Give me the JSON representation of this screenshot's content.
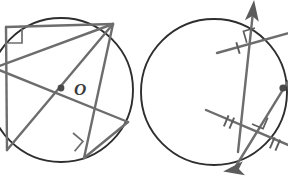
{
  "figure": {
    "background_color": "#ffffff",
    "width": 288,
    "height": 181,
    "colors": {
      "circle_stroke": "#2e2e2e",
      "chord_stroke": "#6d6d6d",
      "mark_stroke": "#5c5c5c",
      "point_fill": "#4a4a4a",
      "label_fill": "#3a3a3a"
    }
  },
  "left_figure": {
    "name": "inscribed-quadrilateral-with-diagonals",
    "circle": {
      "cx": 61,
      "cy": 90,
      "r": 72
    },
    "center_point": {
      "cx": 61,
      "cy": 88,
      "r": 3.2
    },
    "center_label": {
      "text": "O",
      "x": 74,
      "y": 95,
      "font_size": 17
    },
    "vertices": [
      {
        "name": "top-left",
        "x": 6,
        "y": 27
      },
      {
        "name": "top-right",
        "x": 113,
        "y": 24
      },
      {
        "name": "right",
        "x": 128,
        "y": 122
      },
      {
        "name": "bottom",
        "x": 84,
        "y": 158
      },
      {
        "name": "left-upper",
        "x": -6,
        "y": 68
      },
      {
        "name": "left-lower",
        "x": 7,
        "y": 150
      }
    ],
    "segments": [
      {
        "name": "top-chord",
        "x1": 6,
        "y1": 27,
        "x2": 113,
        "y2": 24
      },
      {
        "name": "left-side",
        "x1": 6,
        "y1": 27,
        "x2": 7,
        "y2": 150
      },
      {
        "name": "diagonal-topright-to-left",
        "x1": 113,
        "y1": 24,
        "x2": -6,
        "y2": 68
      },
      {
        "name": "diagonal-left-to-right",
        "x1": -6,
        "y1": 68,
        "x2": 128,
        "y2": 122
      },
      {
        "name": "lower-right-chord",
        "x1": 128,
        "y1": 122,
        "x2": 84,
        "y2": 158
      },
      {
        "name": "diagonal-bottom-to-topright",
        "x1": 84,
        "y1": 158,
        "x2": 113,
        "y2": 24
      },
      {
        "name": "diagonal-leftlower-to-center",
        "x1": 7,
        "y1": 150,
        "x2": 113,
        "y2": 24
      }
    ],
    "right_angle_marks": [
      {
        "name": "top-left-right-angle",
        "x": 10,
        "y": 31,
        "size": 13,
        "rotate": 0
      },
      {
        "name": "bottom-right-angle",
        "x": 72,
        "y": 133,
        "size": 13,
        "rotate": 42
      }
    ]
  },
  "right_figure": {
    "name": "two-chords-with-congruence-marks",
    "circle": {
      "cx": 214,
      "cy": 92,
      "r": 73
    },
    "center_point": {
      "cx": 283,
      "cy": 88,
      "r": 3.4
    },
    "rays": [
      {
        "name": "upper-ray-through-circle",
        "x1": 238,
        "y1": 150,
        "x2": 252,
        "y2": 5,
        "arrow_at": "end"
      },
      {
        "name": "lower-ray-through-circle",
        "x1": 231,
        "y1": 172,
        "x2": 300,
        "y2": 62,
        "arrow_at": "start"
      }
    ],
    "chords": [
      {
        "name": "upper-chord",
        "x1": 217,
        "y1": 53,
        "x2": 300,
        "y2": 30,
        "tick_count": 1
      },
      {
        "name": "lower-chord",
        "x1": 207,
        "y1": 110,
        "x2": 300,
        "y2": 150,
        "tick_count": 2
      }
    ],
    "tick_marks": [
      {
        "name": "upper-chord-tick",
        "x": 244,
        "y": 45,
        "count": 1,
        "angle": -16
      },
      {
        "name": "lower-chord-tick-left",
        "x": 231,
        "y": 123,
        "count": 2,
        "angle": 24
      },
      {
        "name": "lower-chord-tick-right",
        "x": 272,
        "y": 141,
        "count": 2,
        "angle": 24
      }
    ],
    "right_angle_marks": [
      {
        "name": "upper-intersection-right-angle",
        "x": 247,
        "y": 31,
        "size": 12,
        "rotate": -15
      },
      {
        "name": "lower-intersection-right-angle",
        "x": 248,
        "y": 121,
        "size": 12,
        "rotate": 24
      }
    ],
    "arrow_heads": [
      {
        "name": "up-right-arrowhead",
        "x": 252,
        "y": 6,
        "angle": -84
      },
      {
        "name": "down-left-arrowhead",
        "x": 231,
        "y": 172,
        "angle": 122
      }
    ]
  }
}
